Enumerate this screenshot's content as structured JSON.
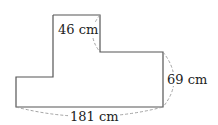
{
  "diagram": {
    "type": "rectilinear-shape-dimensions",
    "labels": {
      "top_width": "46 cm",
      "right_height": "69 cm",
      "bottom_width": "181 cm"
    },
    "colors": {
      "outline": "#555555",
      "dimension_arc": "#999999",
      "text": "#222222"
    }
  }
}
